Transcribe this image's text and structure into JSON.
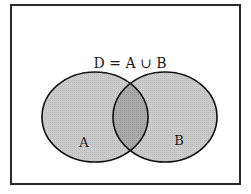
{
  "diagram": {
    "type": "venn",
    "title": "D = A ∪ B",
    "sets": [
      {
        "id": "A",
        "label": "A"
      },
      {
        "id": "B",
        "label": "B"
      }
    ],
    "shaded_regions": [
      "A only",
      "A ∩ B",
      "B only"
    ],
    "colors": {
      "frame": "#2a2a2a",
      "outline": "#111111",
      "set_fill": "#c9c9c9",
      "intersection_fill": "#a6a6a6",
      "background": "#ffffff"
    }
  }
}
